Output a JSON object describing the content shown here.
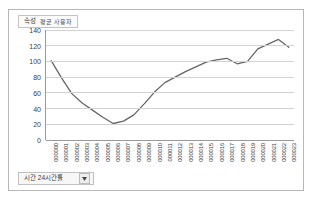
{
  "legend": {
    "label": "속성",
    "series_name": "평균 사용자"
  },
  "dropdown": {
    "label": "시간 24시간률",
    "arrow_icon": "chevron-down-icon"
  },
  "colors": {
    "line": "#666666",
    "grid": "#d2d2d2",
    "axis": "#9a9a9a",
    "frame_border": "#b8b8b8",
    "text": "#3d3d3d",
    "panel_background": "#ffffff"
  },
  "chart_data": {
    "type": "line",
    "title": "",
    "xlabel": "",
    "ylabel": "",
    "ylim": [
      0,
      140
    ],
    "yticks": [
      140,
      120,
      100,
      80,
      60,
      40,
      20,
      0
    ],
    "grid": true,
    "legend_position": "top-left",
    "categories": [
      "000000",
      "000001",
      "000002",
      "000003",
      "000004",
      "000005",
      "000006",
      "000007",
      "000008",
      "000009",
      "000010",
      "000011",
      "000012",
      "000013",
      "000014",
      "000015",
      "000016",
      "000017",
      "000018",
      "000019",
      "000020",
      "000021",
      "000022",
      "000023"
    ],
    "series": [
      {
        "name": "평균 사용자",
        "values": [
          101,
          79,
          59,
          47,
          38,
          29,
          21,
          24,
          32,
          46,
          61,
          73,
          80,
          87,
          93,
          99,
          102,
          104,
          97,
          100,
          116,
          122,
          128,
          118
        ]
      }
    ]
  }
}
